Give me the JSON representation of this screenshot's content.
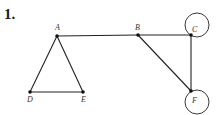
{
  "problem": {
    "number": "1."
  },
  "graph": {
    "vertices": [
      {
        "id": "A",
        "label": "A",
        "x": 57,
        "y": 36,
        "lx": 55,
        "ly": 30
      },
      {
        "id": "B",
        "label": "B",
        "x": 138,
        "y": 35,
        "lx": 135,
        "ly": 30
      },
      {
        "id": "C",
        "label": "C",
        "x": 191,
        "y": 35,
        "lx": 192,
        "ly": 32
      },
      {
        "id": "D",
        "label": "D",
        "x": 30,
        "y": 92,
        "lx": 27,
        "ly": 102
      },
      {
        "id": "E",
        "label": "E",
        "x": 83,
        "y": 92,
        "lx": 81,
        "ly": 102
      },
      {
        "id": "F",
        "label": "F",
        "x": 191,
        "y": 91,
        "lx": 192,
        "ly": 103
      }
    ],
    "edges": [
      [
        "A",
        "D"
      ],
      [
        "A",
        "E"
      ],
      [
        "D",
        "E"
      ],
      [
        "A",
        "B"
      ],
      [
        "B",
        "C"
      ],
      [
        "B",
        "F"
      ],
      [
        "C",
        "F"
      ]
    ],
    "loops": [
      {
        "vertex": "C",
        "cx": 197,
        "cy": 25,
        "r": 12
      },
      {
        "vertex": "F",
        "cx": 197,
        "cy": 102,
        "r": 12
      }
    ],
    "colors": {
      "stroke": "#222222",
      "vertex": "#111111"
    }
  }
}
